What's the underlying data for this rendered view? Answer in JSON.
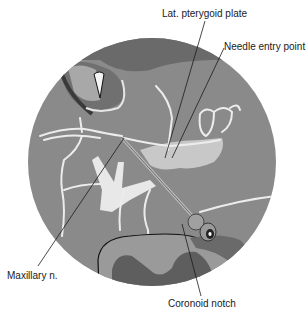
{
  "figure": {
    "colors": {
      "background": "#ffffff",
      "tissue": "#8a8a8a",
      "dark_tissue": "#5e5e5e",
      "light_structure": "#d4d4d4",
      "nerve": "#ececec",
      "leader_line": "#1a1a1a"
    }
  },
  "labels": {
    "lat_pterygoid_plate": "Lat. pterygoid plate",
    "needle_entry_point": "Needle entry point",
    "maxillary_n": "Maxillary n.",
    "coronoid_notch": "Coronoid notch"
  }
}
